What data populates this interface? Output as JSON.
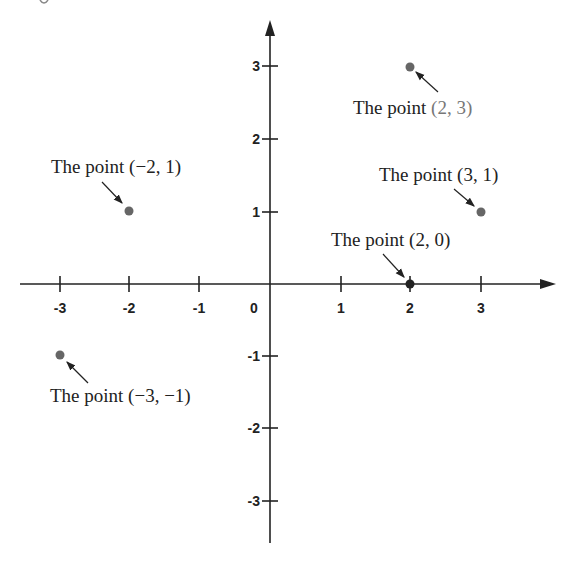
{
  "figure": {
    "x_axis": {
      "ticks": [
        {
          "value": -3,
          "label": "-3",
          "px": 60
        },
        {
          "value": -2,
          "label": "-2",
          "px": 129
        },
        {
          "value": -1,
          "label": "-1",
          "px": 199
        },
        {
          "value": 0,
          "label": "0",
          "px": 270
        },
        {
          "value": 1,
          "label": "1",
          "px": 341
        },
        {
          "value": 2,
          "label": "2",
          "px": 410
        },
        {
          "value": 3,
          "label": "3",
          "px": 481
        }
      ]
    },
    "y_axis": {
      "ticks": [
        {
          "value": 3,
          "label": "3",
          "px": 66
        },
        {
          "value": 2,
          "label": "2",
          "px": 139
        },
        {
          "value": 1,
          "label": "1",
          "px": 212
        },
        {
          "value": -1,
          "label": "-1",
          "px": 356
        },
        {
          "value": -2,
          "label": "-2",
          "px": 428
        },
        {
          "value": -3,
          "label": "-3",
          "px": 501
        }
      ]
    },
    "points": [
      {
        "x": 2,
        "y": 3,
        "prefix": "The point ",
        "coords": "(2, 3)",
        "coords_gray": true
      },
      {
        "x": -2,
        "y": 1,
        "prefix": "The point ",
        "coords": "(−2, 1)",
        "coords_gray": false
      },
      {
        "x": 3,
        "y": 1,
        "prefix": "The point ",
        "coords": "(3, 1)",
        "coords_gray": false
      },
      {
        "x": 2,
        "y": 0,
        "prefix": "The point ",
        "coords": "(2, 0)",
        "coords_gray": false
      },
      {
        "x": -3,
        "y": -1,
        "prefix": "The point ",
        "coords": "(−3, −1)",
        "coords_gray": false
      }
    ],
    "colors": {
      "axis": "#222222",
      "point": "#666666",
      "point_on_axis": "#222222",
      "gray_text": "#777777"
    }
  }
}
